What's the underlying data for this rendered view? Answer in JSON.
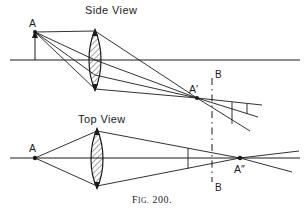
{
  "figure": {
    "caption_prefix": "F",
    "caption_small": "IG.",
    "caption_number": " 200.",
    "caption_full": "Fig. 200.",
    "ink_color": "#1b1b1b",
    "background_color": "#ffffff"
  },
  "panels": {
    "side": {
      "title": "Side View",
      "object_label": "A",
      "image_label": "A′"
    },
    "top": {
      "title": "Top View",
      "object_label": "A",
      "image_label": "A″"
    }
  },
  "markers": {
    "b_top_label": "B",
    "b_bottom_label": "B"
  },
  "diagram_data": {
    "type": "optical-ray-diagram",
    "description": "Astigmatic cylindrical-lens imaging: side view and top view of rays from object point A through a converging lens forming line images A' and A''",
    "side_view": {
      "axis_y": 60,
      "axis_x_range": [
        10,
        300
      ],
      "object_point": {
        "label": "A",
        "x": 35,
        "y": 33
      },
      "object_arrow": {
        "from_y": 60,
        "to_y": 33,
        "x": 35
      },
      "lens": {
        "cx": 95,
        "top_y": 30,
        "bottom_y": 90,
        "half_width": 7,
        "hatched": true
      },
      "image_point": {
        "label": "A′",
        "x": 197,
        "y": 98
      },
      "rays_from_object": [
        {
          "to_x": 95,
          "to_y": 30
        },
        {
          "to_x": 95,
          "to_y": 60
        },
        {
          "to_x": 95,
          "to_y": 90
        }
      ],
      "rays_after_lens_converge_at": {
        "x": 197,
        "y": 98
      },
      "diverging_rays_right": [
        {
          "x2": 258,
          "y2": 110
        },
        {
          "x2": 252,
          "y2": 122
        },
        {
          "x2": 244,
          "y2": 134
        }
      ],
      "screen_segments": [
        {
          "x": 246,
          "y1": 105,
          "y2": 128
        },
        {
          "x": 232,
          "y1": 101,
          "y2": 125
        }
      ]
    },
    "top_view": {
      "axis_y": 158,
      "axis_x_range": [
        10,
        300
      ],
      "object_point": {
        "label": "A",
        "x": 35,
        "y": 158
      },
      "lens": {
        "cx": 97,
        "top_y": 129,
        "bottom_y": 188,
        "half_width": 7,
        "hatched": true
      },
      "image_point": {
        "label": "A″",
        "x": 240,
        "y": 158
      },
      "rays": [
        {
          "from_x": 35,
          "from_y": 158,
          "to_x": 97,
          "to_y": 130
        },
        {
          "from_x": 35,
          "from_y": 158,
          "to_x": 97,
          "to_y": 187
        }
      ],
      "converge_at": {
        "x": 240,
        "y": 158
      },
      "diverging_rays_right": [
        {
          "x2": 297,
          "y2": 152
        },
        {
          "x2": 292,
          "y2": 170
        }
      ],
      "screen_segment": {
        "x": 188,
        "y1": 148,
        "y2": 169
      }
    },
    "bb_plane": {
      "x": 212,
      "y_top": 78,
      "y_bottom": 182,
      "style": "dash-dot",
      "top_label": "B",
      "bottom_label": "B"
    }
  }
}
